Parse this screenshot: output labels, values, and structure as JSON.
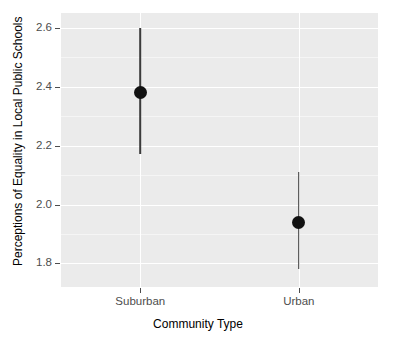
{
  "chart_data": {
    "type": "scatter",
    "title": "",
    "subtitle": "",
    "xlabel": "Community Type",
    "ylabel": "Perceptions of Equality in Local Public Schools",
    "categories": [
      "Suburban",
      "Urban"
    ],
    "values": [
      2.38,
      1.94
    ],
    "error_low": [
      2.17,
      1.78
    ],
    "error_high": [
      2.6,
      2.11
    ],
    "series": [
      {
        "name": "Estimated mean with 95% interval",
        "points": [
          {
            "category": "Suburban",
            "value": 2.38,
            "low": 2.17,
            "high": 2.6
          },
          {
            "category": "Urban",
            "value": 1.94,
            "low": 1.78,
            "high": 2.11
          }
        ]
      }
    ],
    "ylim": [
      1.72,
      2.65
    ],
    "yticks": [
      "1.8",
      "2.0",
      "2.2",
      "2.4",
      "2.6"
    ],
    "ytick_values": [
      1.8,
      2.0,
      2.2,
      2.4,
      2.6
    ],
    "yminor_values": [
      1.9,
      2.1,
      2.3,
      2.5
    ],
    "grid": true,
    "legend": "none",
    "panel_background": "#ebebeb",
    "grid_color": "#ffffff",
    "point_color": "#111111",
    "errorbar_color": "#3b3b3b"
  },
  "axes": {
    "y": {
      "title": "Perceptions of Equality in Local Public Schools",
      "ticks": [
        {
          "label": "2.6",
          "value": 2.6
        },
        {
          "label": "2.4",
          "value": 2.4
        },
        {
          "label": "2.2",
          "value": 2.2
        },
        {
          "label": "2.0",
          "value": 2.0
        },
        {
          "label": "1.8",
          "value": 1.8
        }
      ]
    },
    "x": {
      "title": "Community Type",
      "ticks": [
        {
          "label": "Suburban"
        },
        {
          "label": "Urban"
        }
      ]
    }
  }
}
